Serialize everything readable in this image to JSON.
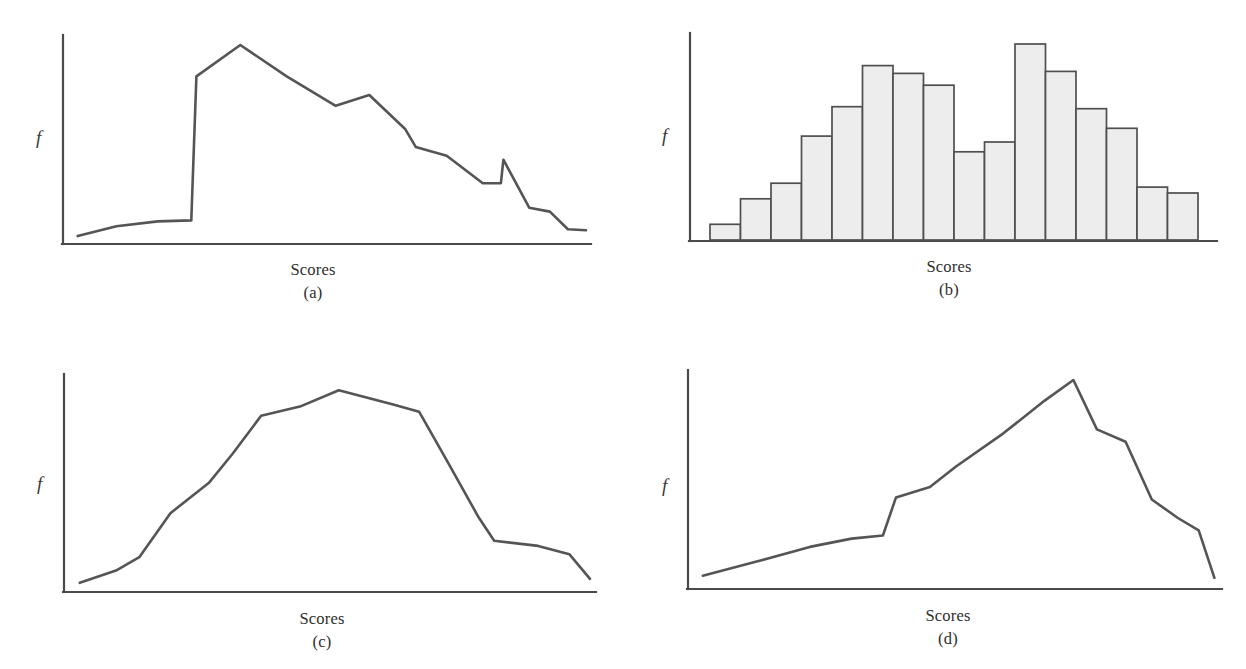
{
  "figure": {
    "background_color": "#ffffff",
    "line_color": "#555555",
    "axis_color": "#4a4a4a",
    "bar_fill_color": "#ededed",
    "bar_stroke_color": "#4f4f4f"
  },
  "panels": [
    {
      "id": "a",
      "caption_id": "(a)",
      "xlabel": "Scores",
      "ylabel": "f"
    },
    {
      "id": "b",
      "caption_id": "(b)",
      "xlabel": "Scores",
      "ylabel": "f"
    },
    {
      "id": "c",
      "caption_id": "(c)",
      "xlabel": "Scores",
      "ylabel": "f"
    },
    {
      "id": "d",
      "caption_id": "(d)",
      "xlabel": "Scores",
      "ylabel": "f"
    }
  ],
  "chart_data": [
    {
      "type": "line",
      "title": "(a)",
      "xlabel": "Scores",
      "ylabel": "f",
      "grid": false,
      "legend": "none",
      "xlim": [
        0,
        100
      ],
      "ylim": [
        0,
        100
      ],
      "shape_description": "negatively skewed / sharp rise then long decline",
      "x": [
        1.5,
        9,
        17,
        23.5,
        24.5,
        33,
        42,
        51.5,
        58,
        65,
        67,
        73,
        80,
        83.5,
        84,
        89,
        93,
        96.5,
        100
      ],
      "y": [
        2.5,
        7.5,
        10,
        10.5,
        84,
        100,
        84,
        69,
        74.5,
        57,
        48,
        43.5,
        29.5,
        29.5,
        41.5,
        17,
        15,
        6,
        5.5
      ]
    },
    {
      "type": "bar",
      "title": "(b)",
      "xlabel": "Scores",
      "ylabel": "f",
      "grid": false,
      "legend": "none",
      "ylim": [
        0,
        100
      ],
      "shape_description": "bimodal histogram, 15 class intervals",
      "categories": [
        "1",
        "2",
        "3",
        "4",
        "5",
        "6",
        "7",
        "8",
        "9",
        "10",
        "11",
        "12",
        "13",
        "14",
        "15"
      ],
      "values": [
        8,
        21,
        29,
        53,
        68,
        89,
        85,
        79,
        45,
        50,
        100,
        86,
        67,
        57,
        27,
        24
      ]
    },
    {
      "type": "line",
      "title": "(c)",
      "xlabel": "Scores",
      "ylabel": "f",
      "grid": false,
      "legend": "none",
      "xlim": [
        0,
        100
      ],
      "ylim": [
        0,
        100
      ],
      "shape_description": "symmetric, broad peaked (mesokurtic/plateau)",
      "x": [
        1.5,
        8.5,
        13,
        19,
        26.5,
        31,
        36.5,
        44,
        51.5,
        62,
        67,
        72.5,
        78.5,
        81.5,
        90,
        96,
        100
      ],
      "y": [
        3,
        9,
        15.5,
        37,
        52,
        66,
        84.5,
        89,
        97,
        90,
        86.5,
        62,
        35,
        23.5,
        21,
        17,
        5
      ]
    },
    {
      "type": "line",
      "title": "(d)",
      "xlabel": "Scores",
      "ylabel": "f",
      "grid": false,
      "legend": "none",
      "xlim": [
        0,
        100
      ],
      "ylim": [
        0,
        100
      ],
      "shape_description": "positively accelerating rise to a late sharp peak, then steep fall",
      "x": [
        1.5,
        12,
        22,
        30,
        36,
        38.5,
        45,
        50,
        59,
        67,
        72.5,
        77,
        82.5,
        87.5,
        92.5,
        96.5,
        99.5
      ],
      "y": [
        5,
        12,
        19,
        23,
        24.5,
        43,
        48,
        58,
        74,
        90,
        100,
        76,
        70,
        42,
        33,
        27,
        4
      ]
    }
  ]
}
